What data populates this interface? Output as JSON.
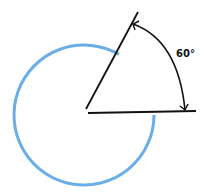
{
  "diagram": {
    "type": "angle-in-circle",
    "angle_label": "60°",
    "angle_degrees": 60,
    "circle_sweep_degrees": 300,
    "colors": {
      "circle": "#6aaee8",
      "lines": "#111111"
    }
  }
}
